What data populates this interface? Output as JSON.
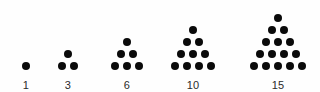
{
  "figure": {
    "background_color": "#fefefe",
    "dot_color": "#0a0a0a",
    "label_color": "#2b2b2b"
  },
  "chart_data": {
    "type": "scatter",
    "title": "",
    "subtitle": "",
    "xlabel": "",
    "ylabel": "",
    "grid": false,
    "legend": null,
    "categories": [
      "1",
      "3",
      "6",
      "10",
      "15"
    ],
    "values": [
      1,
      3,
      6,
      10,
      15
    ],
    "groups": [
      {
        "label": "1",
        "rows": 1,
        "total_dots": 1,
        "row_counts": [
          1
        ],
        "center_x": 26
      },
      {
        "label": "3",
        "rows": 2,
        "total_dots": 3,
        "row_counts": [
          1,
          2
        ],
        "center_x": 68
      },
      {
        "label": "6",
        "rows": 3,
        "total_dots": 6,
        "row_counts": [
          1,
          2,
          3
        ],
        "center_x": 127
      },
      {
        "label": "10",
        "rows": 4,
        "total_dots": 10,
        "row_counts": [
          1,
          2,
          3,
          4
        ],
        "center_x": 193
      },
      {
        "label": "15",
        "rows": 5,
        "total_dots": 15,
        "row_counts": [
          1,
          2,
          3,
          4,
          5
        ],
        "center_x": 278
      }
    ]
  }
}
